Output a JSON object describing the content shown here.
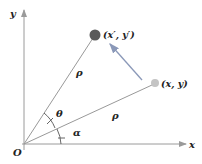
{
  "diagram": {
    "axes": {
      "x_label": "x",
      "y_label": "y",
      "origin_label": "O",
      "color": "#9a9a9a"
    },
    "points": [
      {
        "id": "rotated",
        "label": "(x′, y′)",
        "color": "#5a5a5a",
        "radius": 5.5
      },
      {
        "id": "original",
        "label": "(x, y)",
        "color": "#c4c4c4",
        "radius": 4
      }
    ],
    "radius_labels": {
      "upper": "ρ",
      "lower": "ρ"
    },
    "angle_labels": {
      "theta": "θ",
      "alpha": "α"
    },
    "line_color": "#999999",
    "arrow_color": "#8a98b8"
  }
}
